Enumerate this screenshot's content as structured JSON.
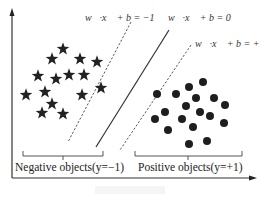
{
  "diagram": {
    "colors": {
      "axis": "#333333",
      "hyperplane": "#333333",
      "margin": "#444444",
      "star": "#222222",
      "circle": "#1e1e1e",
      "text": "#222222"
    },
    "labels": {
      "margin_negative": "w⃗·x⃗ + b = −1",
      "hyperplane": "w⃗·x⃗ + b = 0",
      "margin_positive": "w⃗·x⃗ + b = +1",
      "negative_class": "Negative objects(y=−1)",
      "positive_class": "Positive objects(y=+1)"
    },
    "lines": {
      "margin_negative": {
        "x1": 131,
        "y1": 22,
        "x2": 68,
        "y2": 142,
        "style": "dashed"
      },
      "hyperplane": {
        "x1": 169,
        "y1": 30,
        "x2": 96,
        "y2": 147,
        "style": "solid"
      },
      "margin_positive": {
        "x1": 191,
        "y1": 45,
        "x2": 120,
        "y2": 150,
        "style": "dashed"
      }
    },
    "negative_points_icon": "star-icon",
    "positive_points_icon": "circle-icon",
    "negative_points": [
      [
        63,
        49
      ],
      [
        52,
        59
      ],
      [
        80,
        59
      ],
      [
        97,
        62
      ],
      [
        38,
        76
      ],
      [
        56,
        79
      ],
      [
        69,
        75
      ],
      [
        84,
        75
      ],
      [
        26,
        95
      ],
      [
        45,
        92
      ],
      [
        82,
        95
      ],
      [
        101,
        88
      ],
      [
        52,
        104
      ],
      [
        42,
        113
      ],
      [
        63,
        114
      ]
    ],
    "positive_points": [
      [
        157,
        94
      ],
      [
        176,
        94
      ],
      [
        189,
        87
      ],
      [
        203,
        82
      ],
      [
        214,
        98
      ],
      [
        196,
        98
      ],
      [
        186,
        106
      ],
      [
        225,
        105
      ],
      [
        200,
        112
      ],
      [
        210,
        116
      ],
      [
        155,
        119
      ],
      [
        165,
        112
      ],
      [
        182,
        119
      ],
      [
        193,
        127
      ],
      [
        224,
        123
      ],
      [
        168,
        130
      ],
      [
        189,
        144
      ],
      [
        207,
        141
      ]
    ]
  }
}
